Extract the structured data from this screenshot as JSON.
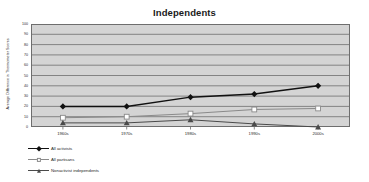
{
  "chart_data": {
    "type": "line",
    "title": "Independents",
    "xlabel": "",
    "ylabel": "Average Difference in Thermometer Scores",
    "categories": [
      "1960s",
      "1970s",
      "1980s",
      "1990s",
      "2000s"
    ],
    "ylim": [
      0,
      100
    ],
    "yticks": [
      0,
      10,
      20,
      30,
      40,
      50,
      60,
      70,
      80,
      90,
      100
    ],
    "grid": true,
    "legend_position": "bottom-left",
    "series": [
      {
        "name": "All activists",
        "marker": "filled-diamond",
        "color": "#111111",
        "values": [
          20,
          20,
          29,
          32,
          40
        ]
      },
      {
        "name": "All partisans",
        "marker": "open-square",
        "color": "#8a8a8a",
        "values": [
          9,
          10,
          13,
          17,
          18
        ]
      },
      {
        "name": "Nonactivist independents",
        "marker": "filled-triangle",
        "color": "#4a4a4a",
        "values": [
          4,
          4,
          7,
          3,
          0
        ]
      }
    ],
    "colors": {
      "plot_background": "#d4d4d4",
      "gridline": "#6e6e6e",
      "axis": "#6e6e6e",
      "page_background": "#ffffff",
      "text": "#2b2b2b"
    }
  }
}
